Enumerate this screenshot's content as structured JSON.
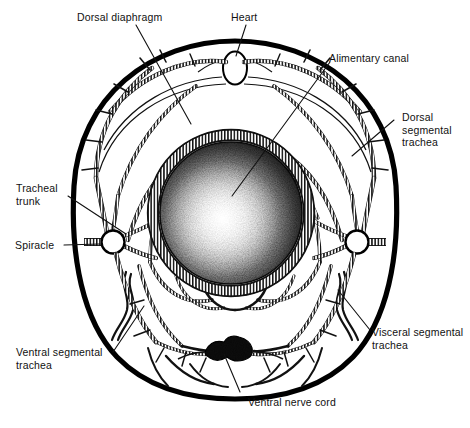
{
  "figure": {
    "ink_color": "#000000",
    "background_color": "#ffffff"
  },
  "labels": {
    "dorsal_diaphragm": "Dorsal diaphragm",
    "heart": "Heart",
    "alimentary_canal": "Alimentary canal",
    "dorsal_segmental_trachea": "Dorsal\nsegmental\ntrachea",
    "tracheal_trunk": "Tracheal\ntrunk",
    "spiracle": "Spiracle",
    "ventral_segmental_trachea": "Ventral segmental\ntrachea",
    "visceral_segmental_trachea": "Visceral segmental\ntrachea",
    "ventral_nerve_cord": "Ventral nerve cord"
  },
  "structures": {
    "body_wall": "body-wall-outline",
    "heart_shape": "dorsal-vessel-oval",
    "gut": "alimentary-canal-stippled-disc",
    "gut_ring": "visceral-trachea-ring",
    "nerve_cord": "ventral-nerve-cord-ganglion",
    "spiracle_left": "left-spiracle-opening",
    "spiracle_right": "right-spiracle-opening"
  }
}
